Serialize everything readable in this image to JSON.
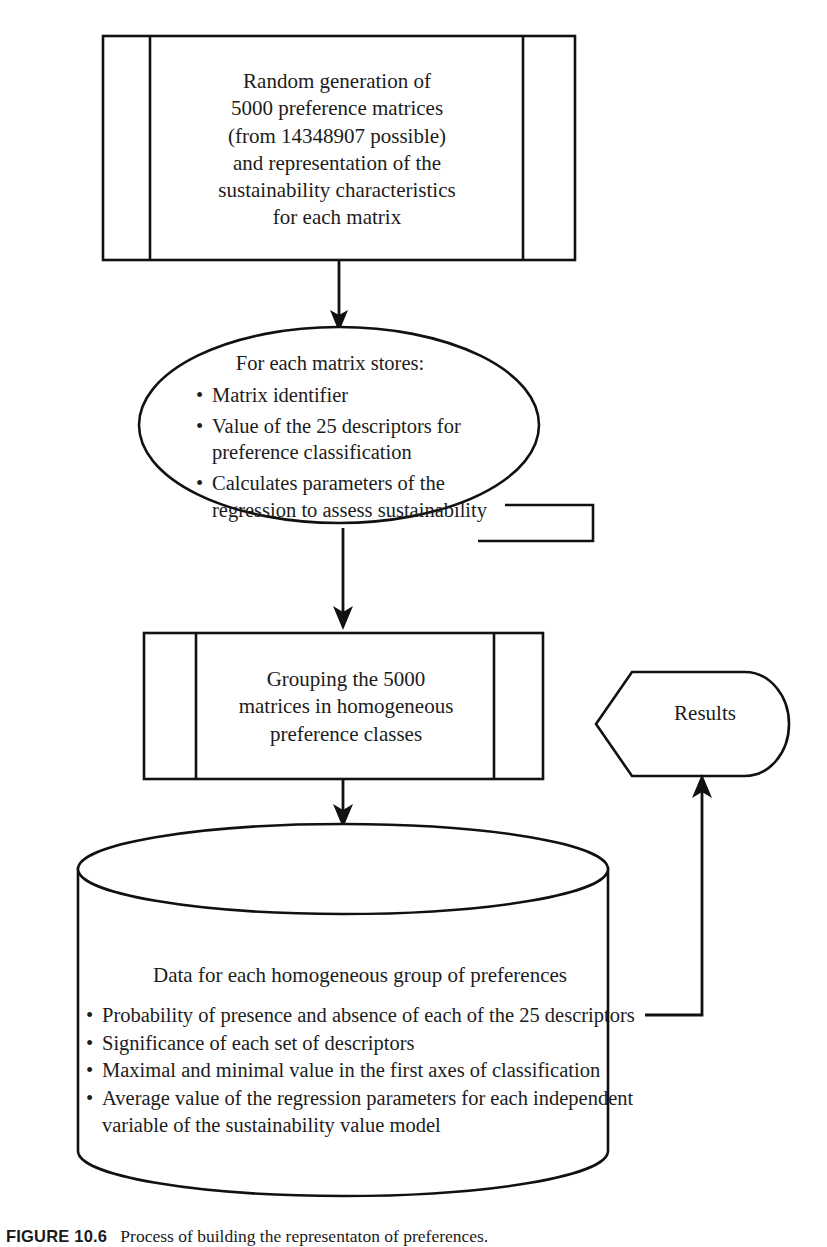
{
  "figure": {
    "caption_label": "FIGURE 10.6",
    "caption_text": "Process of  building the representaton  of preferences."
  },
  "colors": {
    "stroke": "#111111",
    "text": "#1c1c1c",
    "background": "#ffffff"
  },
  "nodes": {
    "process_generation": {
      "shape": "predefined-process",
      "text": "Random generation of\n5000 preference matrices\n(from 14348907 possible)\nand representation of the\nsustainability characteristics\nfor each matrix",
      "lines": [
        "Random generation of",
        "5000 preference matrices",
        "(from 14348907 possible)",
        "and representation of the",
        "sustainability characteristics",
        "for each matrix"
      ]
    },
    "storage_ellipse": {
      "shape": "ellipse",
      "title": "For each matrix stores:",
      "bullets": [
        "Matrix identifier",
        "Value of the 25 descriptors for preference classification",
        "Calculates parameters of the regression to assess sustainability"
      ]
    },
    "process_grouping": {
      "shape": "predefined-process",
      "lines": [
        "Grouping the 5000",
        "matrices in homogeneous",
        "preference classes"
      ]
    },
    "results_display": {
      "shape": "display",
      "label": "Results"
    },
    "database_cylinder": {
      "shape": "cylinder",
      "title": "Data for each homogeneous group of preferences",
      "bullets": [
        "Probability of presence and absence of each of the 25 descriptors",
        "Significance of each set  of descriptors",
        "Maximal and minimal value in the first axes of classification",
        "Average value of the regression parameters for each independent variable of the sustainability value model"
      ]
    }
  },
  "connectors": [
    {
      "name": "generation-to-storage",
      "from": "process_generation",
      "to": "storage_ellipse",
      "direction": "down",
      "arrow": true
    },
    {
      "name": "storage-to-grouping",
      "from": "storage_ellipse",
      "to": "process_grouping",
      "direction": "down",
      "arrow": true
    },
    {
      "name": "grouping-to-database",
      "from": "process_grouping",
      "to": "database_cylinder",
      "direction": "down",
      "arrow": true
    },
    {
      "name": "database-to-results",
      "from": "database_cylinder",
      "to": "results_display",
      "direction": "right-up",
      "arrow": true
    }
  ]
}
